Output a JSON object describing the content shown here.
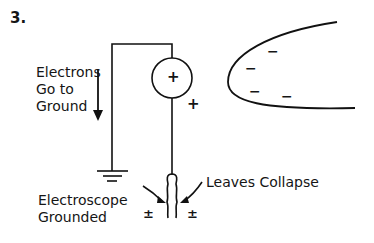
{
  "figure": {
    "number": "3.",
    "labels": {
      "electrons_line1": "Electrons",
      "electrons_line2": "Go to",
      "electrons_line3": "Ground",
      "electroscope_line1": "Electroscope",
      "electroscope_line2": "Grounded",
      "leaves": "Leaves Collapse"
    },
    "symbols": {
      "knob_charge": "+",
      "wire_charge": "+",
      "leaf_left_charge": "±",
      "leaf_right_charge": "±",
      "rod_charges": [
        "−",
        "−",
        "−",
        "−"
      ]
    },
    "components": [
      "electroscope-knob",
      "ground-wire",
      "ground-symbol",
      "leaves",
      "charged-rod"
    ]
  }
}
